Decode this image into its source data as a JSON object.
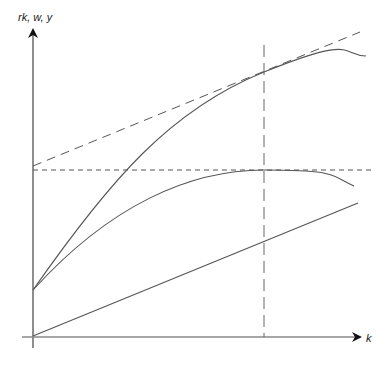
{
  "diagram": {
    "type": "economics-growth-diagram",
    "y_axis_label": "rk, w, y",
    "x_axis_label": "k",
    "elements": [
      {
        "name": "output-curve-y",
        "style": "solid",
        "description": "concave production curve starting at intercept"
      },
      {
        "name": "wage-curve-w",
        "style": "solid",
        "description": "hump-shaped curve peaking at k*"
      },
      {
        "name": "capital-income-line-rk",
        "style": "solid",
        "description": "straight line from origin"
      },
      {
        "name": "tangent-line",
        "style": "dashed",
        "description": "tangent to output curve at k*"
      },
      {
        "name": "max-wage-line",
        "style": "dashed",
        "description": "horizontal line at wage maximum"
      },
      {
        "name": "k-star-line",
        "style": "dashed",
        "description": "vertical line at k*"
      }
    ]
  },
  "colors": {
    "line": "#555555",
    "axis": "#333333",
    "background": "#ffffff"
  }
}
